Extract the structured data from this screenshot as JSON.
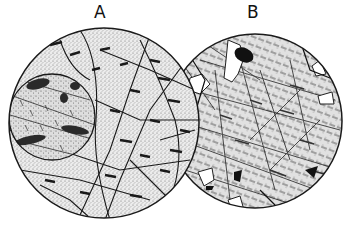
{
  "figure": {
    "panels": [
      {
        "label": "A",
        "description": "thin section with rounded inclusion, stippled grains, dark elongate crystals and fractures"
      },
      {
        "label": "B",
        "description": "thin section with dense lath/needle texture, white clear patches and opaque black grains"
      }
    ]
  },
  "colors": {
    "background": "#ffffff",
    "ink": "#1a1a1a",
    "stipple": "#cfcfcf",
    "field": "#e8e8e8"
  }
}
